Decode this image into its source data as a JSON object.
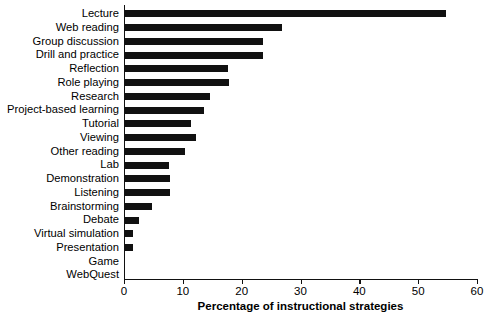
{
  "chart_data": {
    "type": "bar",
    "orientation": "horizontal",
    "title": "",
    "xlabel": "Percentage of instructional strategies",
    "ylabel": "",
    "xlim": [
      0,
      60
    ],
    "xticks": [
      0,
      10,
      20,
      30,
      40,
      50,
      60
    ],
    "grid": false,
    "legend": null,
    "bar_color": "#111111",
    "axis_color": "#111111",
    "categories": [
      "Lecture",
      "Web reading",
      "Group discussion",
      "Drill and practice",
      "Reflection",
      "Role playing",
      "Research",
      "Project-based learning",
      "Tutorial",
      "Viewing",
      "Other reading",
      "Lab",
      "Demonstration",
      "Listening",
      "Brainstorming",
      "Debate",
      "Virtual simulation",
      "Presentation",
      "Game",
      "WebQuest"
    ],
    "values": [
      54.8,
      26.9,
      23.6,
      23.6,
      17.7,
      17.9,
      14.6,
      13.6,
      11.4,
      12.2,
      10.4,
      7.7,
      7.8,
      7.8,
      4.8,
      2.5,
      1.5,
      1.5,
      0,
      0
    ]
  }
}
